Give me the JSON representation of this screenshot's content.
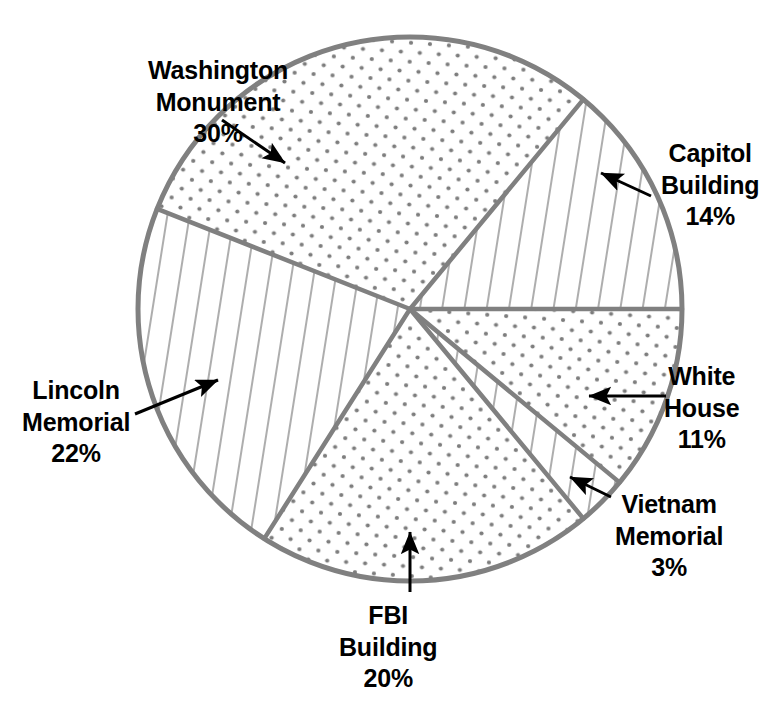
{
  "chart_data": {
    "type": "pie",
    "title": "",
    "subtitle": "",
    "xlabel": "",
    "ylabel": "",
    "grid": false,
    "legend_position": "none",
    "units": "percent",
    "total": 100,
    "center": {
      "x": 410,
      "y": 309
    },
    "radius": 272,
    "start_angle_deg": 0,
    "direction": "counterclockwise",
    "categories": [
      "Capitol Building",
      "Washington Monument",
      "Lincoln Memorial",
      "FBI Building",
      "Vietnam Memorial",
      "White House"
    ],
    "values": [
      14,
      30,
      22,
      20,
      3,
      11
    ],
    "slices": [
      {
        "name": "capitol-building",
        "label_line1": "Capitol",
        "label_line2": "Building",
        "value_text": "14%",
        "value": 14,
        "fill_pattern": "diagonal-hatch",
        "start_deg": 0,
        "end_deg": 50.4,
        "label_x": 661,
        "label_y": 138,
        "leader": {
          "type": "arrow",
          "x1": 651,
          "y1": 196,
          "x2": 601,
          "y2": 173
        }
      },
      {
        "name": "washington-monument",
        "label_line1": "Washington",
        "label_line2": "Monument",
        "value_text": "30%",
        "value": 30,
        "fill_pattern": "dots",
        "start_deg": 50.4,
        "end_deg": 158.4,
        "label_x": 148,
        "label_y": 55,
        "leader": {
          "type": "arrow",
          "x1": 222,
          "y1": 120,
          "x2": 285,
          "y2": 163
        }
      },
      {
        "name": "lincoln-memorial",
        "label_line1": "Lincoln",
        "label_line2": "Memorial",
        "value_text": "22%",
        "value": 22,
        "fill_pattern": "diagonal-hatch",
        "start_deg": 158.4,
        "end_deg": 237.6,
        "label_x": 22,
        "label_y": 375,
        "leader": {
          "type": "arrow",
          "x1": 135,
          "y1": 414,
          "x2": 218,
          "y2": 380
        }
      },
      {
        "name": "fbi-building",
        "label_line1": "FBI",
        "label_line2": "Building",
        "value_text": "20%",
        "value": 20,
        "fill_pattern": "dots",
        "start_deg": 237.6,
        "end_deg": 309.6,
        "label_x": 339,
        "label_y": 600,
        "leader": {
          "type": "arrow",
          "x1": 410,
          "y1": 592,
          "x2": 410,
          "y2": 532
        }
      },
      {
        "name": "vietnam-memorial",
        "label_line1": "Vietnam",
        "label_line2": "Memorial",
        "value_text": "3%",
        "value": 3,
        "fill_pattern": "diagonal-hatch",
        "start_deg": 309.6,
        "end_deg": 320.4,
        "label_x": 615,
        "label_y": 489,
        "leader": {
          "type": "arrow",
          "x1": 611,
          "y1": 497,
          "x2": 570,
          "y2": 477
        }
      },
      {
        "name": "white-house",
        "label_line1": "White",
        "label_line2": "House",
        "value_text": "11%",
        "value": 11,
        "fill_pattern": "dots",
        "start_deg": 320.4,
        "end_deg": 360,
        "label_x": 664,
        "label_y": 361,
        "leader": {
          "type": "arrow",
          "x1": 666,
          "y1": 396,
          "x2": 589,
          "y2": 396
        }
      }
    ],
    "colors": {
      "outline": "#808080",
      "divider": "#808080",
      "hatch": "#999999",
      "dot": "#7d7d7d",
      "text": "#000000",
      "arrow": "#000000",
      "background": "#ffffff"
    }
  }
}
